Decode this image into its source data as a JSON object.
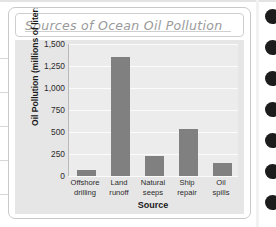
{
  "card": {
    "title": "Sources of Ocean Oil Pollution"
  },
  "chart_data": {
    "type": "bar",
    "title": "Sources of Ocean Oil Pollution",
    "xlabel": "Source",
    "ylabel": "Oil Pollution (millions of liters)",
    "categories": [
      "Offshore drilling",
      "Land runoff",
      "Natural seeps",
      "Ship repair",
      "Oil spills"
    ],
    "category_lines": [
      [
        "Offshore",
        "drilling"
      ],
      [
        "Land",
        "runoff"
      ],
      [
        "Natural",
        "seeps"
      ],
      [
        "Ship",
        "repair"
      ],
      [
        "Oil",
        "spills"
      ]
    ],
    "values": [
      70,
      1350,
      230,
      530,
      150
    ],
    "ylim": [
      0,
      1500
    ],
    "yticks": [
      0,
      250,
      500,
      750,
      1000,
      1250,
      1500
    ],
    "ytick_labels": [
      "0",
      "250",
      "500",
      "750",
      "1,000",
      "1,250",
      "1,500"
    ],
    "grid": true,
    "legend": false,
    "bar_color": "#808080",
    "plot_background": "#ececec",
    "panel_background": "#e6e6e6"
  },
  "decor": {
    "binding_hole_color": "#1c1c1c",
    "binding_hole_count": 7
  }
}
